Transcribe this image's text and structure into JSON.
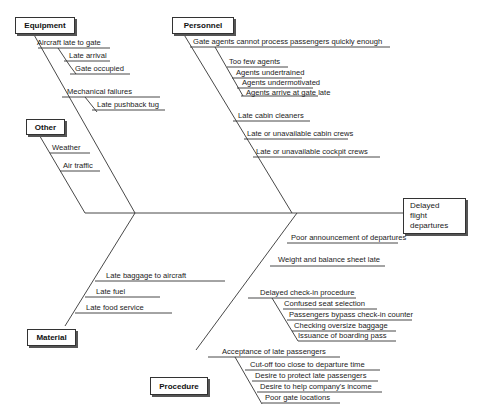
{
  "diagram": {
    "type": "fishbone",
    "effect": {
      "lines": [
        "Delayed",
        "flight",
        "departures"
      ]
    },
    "categories": {
      "equipment": {
        "label": "Equipment",
        "causes": [
          {
            "text": "Aircraft late to gate",
            "sub": [
              "Late arrival",
              "Gate occupied"
            ]
          },
          {
            "text": "Mechanical failures",
            "sub": [
              "Late pushback tug"
            ]
          }
        ]
      },
      "personnel": {
        "label": "Personnel",
        "causes": [
          {
            "text": "Gate agents cannot process passengers quickly enough",
            "sub": [
              "Too few agents",
              "Agents undertrained",
              "Agents undermotivated",
              "Agents arrive at gate late"
            ]
          },
          {
            "text": "Late cabin cleaners",
            "sub": []
          },
          {
            "text": "Late or unavailable cabin crews",
            "sub": []
          },
          {
            "text": "Late or unavailable cockpit crews",
            "sub": []
          }
        ]
      },
      "other": {
        "label": "Other",
        "causes": [
          {
            "text": "Weather",
            "sub": []
          },
          {
            "text": "Air traffic",
            "sub": []
          }
        ]
      },
      "material": {
        "label": "Material",
        "causes": [
          {
            "text": "Late baggage to aircraft",
            "sub": []
          },
          {
            "text": "Late fuel",
            "sub": []
          },
          {
            "text": "Late food service",
            "sub": []
          }
        ]
      },
      "procedure": {
        "label": "Procedure",
        "causes": [
          {
            "text": "Poor announcement of departures",
            "sub": []
          },
          {
            "text": "Weight and balance sheet late",
            "sub": []
          },
          {
            "text": "Delayed check-in procedure",
            "sub": [
              "Confused seat selection",
              "Passengers bypass check-in counter",
              "Checking oversize baggage",
              "Issuance of boarding pass"
            ]
          },
          {
            "text": "Acceptance of late passengers",
            "sub": [
              "Cut-off too close to departure time",
              "Desire to protect late passengers",
              "Desire to help company's income",
              "Poor gate locations"
            ]
          }
        ]
      }
    }
  }
}
